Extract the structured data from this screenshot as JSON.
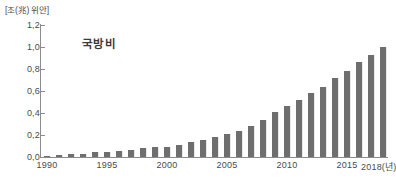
{
  "chart_data": {
    "type": "bar",
    "title": "국방비",
    "unit_label": "[조(兆) 위안]",
    "xlabel": "",
    "ylabel": "",
    "ylim": [
      0.0,
      1.2
    ],
    "grid": false,
    "legend": null,
    "decimal_separator": ",",
    "bar_color": "#6e6e6e",
    "axis_color": "#8c8c8c",
    "text_color": "#4a4a4a",
    "background": "#ffffff",
    "y_ticks": [
      "0,0",
      "0,2",
      "0,4",
      "0,6",
      "0,8",
      "1,0",
      "1,2"
    ],
    "y_tick_values": [
      0.0,
      0.2,
      0.4,
      0.6,
      0.8,
      1.0,
      1.2
    ],
    "x_tick_labels": [
      "1990",
      "1995",
      "2000",
      "2005",
      "2010",
      "2015",
      "2018(년)"
    ],
    "x_tick_years": [
      1990,
      1995,
      2000,
      2005,
      2010,
      2015,
      2018
    ],
    "categories": [
      "1990",
      "1991",
      "1992",
      "1993",
      "1994",
      "1995",
      "1996",
      "1997",
      "1998",
      "1999",
      "2000",
      "2001",
      "2002",
      "2003",
      "2004",
      "2005",
      "2006",
      "2007",
      "2008",
      "2009",
      "2010",
      "2011",
      "2012",
      "2013",
      "2014",
      "2015",
      "2016",
      "2017",
      "2018"
    ],
    "values": [
      0.012,
      0.02,
      0.024,
      0.031,
      0.045,
      0.049,
      0.056,
      0.065,
      0.078,
      0.088,
      0.095,
      0.106,
      0.134,
      0.156,
      0.178,
      0.206,
      0.235,
      0.285,
      0.341,
      0.406,
      0.468,
      0.516,
      0.583,
      0.641,
      0.717,
      0.781,
      0.861,
      0.93,
      1.0
    ]
  }
}
